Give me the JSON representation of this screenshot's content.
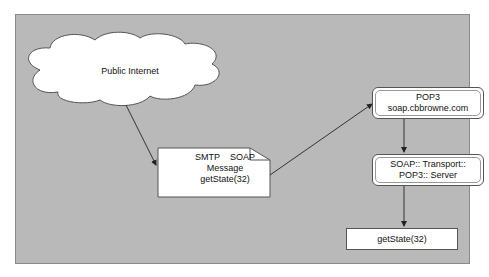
{
  "diagram": {
    "cloud": {
      "label": "Public Internet"
    },
    "message": {
      "line1": "SMTP    SOAP",
      "line2": "Message",
      "line3": "getState(32)"
    },
    "pop3": {
      "line1": "POP3",
      "line2": "soap.cbbrowne.com"
    },
    "server": {
      "line1": "SOAP:: Transport::",
      "line2": "POP3:: Server"
    },
    "result": {
      "label": "getState(32)"
    }
  },
  "edges": [
    {
      "from": "cloud",
      "to": "message"
    },
    {
      "from": "message",
      "to": "pop3"
    },
    {
      "from": "pop3",
      "to": "server"
    },
    {
      "from": "server",
      "to": "result"
    }
  ],
  "colors": {
    "panel": "#b9b9b9",
    "node_fill": "#ffffff",
    "line": "#333333"
  }
}
